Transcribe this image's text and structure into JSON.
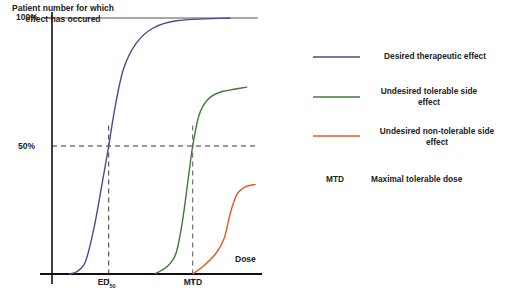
{
  "chart_data": {
    "type": "line",
    "title": "",
    "ylabel": "Patient number for which effect has occured",
    "xlabel": "Dose",
    "ylim": [
      0,
      100
    ],
    "xlim": [
      0,
      100
    ],
    "y_ticks": [
      {
        "value": 100,
        "label": "100%"
      },
      {
        "value": 50,
        "label": "50%"
      }
    ],
    "x_markers": [
      {
        "name": "ED50",
        "label_main": "ED",
        "label_sub": "50",
        "x": 27
      },
      {
        "name": "MTD",
        "label_main": "MTD",
        "label_sub": "",
        "x": 67
      }
    ],
    "reference_lines": [
      {
        "orientation": "horizontal",
        "y": 100,
        "style": "solid"
      },
      {
        "orientation": "horizontal",
        "y": 50,
        "style": "dashed"
      }
    ],
    "series": [
      {
        "name": "Desired therapeutic effect",
        "color": "#4b4a8c",
        "points": [
          [
            8,
            0
          ],
          [
            12,
            1
          ],
          [
            16,
            5
          ],
          [
            20,
            18
          ],
          [
            24,
            36
          ],
          [
            27,
            50
          ],
          [
            30,
            65
          ],
          [
            34,
            80
          ],
          [
            40,
            90
          ],
          [
            48,
            96
          ],
          [
            60,
            99
          ],
          [
            85,
            100
          ]
        ]
      },
      {
        "name": "Undesired tolerable side effect",
        "color": "#3f7a3a",
        "points": [
          [
            49,
            0
          ],
          [
            55,
            3
          ],
          [
            59,
            8
          ],
          [
            62,
            20
          ],
          [
            65,
            38
          ],
          [
            67,
            50
          ],
          [
            70,
            62
          ],
          [
            74,
            68
          ],
          [
            80,
            71
          ],
          [
            93,
            73
          ]
        ]
      },
      {
        "name": "Undesired non-tolerable side effect",
        "color": "#e8562a",
        "points": [
          [
            67,
            0
          ],
          [
            72,
            3
          ],
          [
            78,
            8
          ],
          [
            82,
            14
          ],
          [
            85,
            24
          ],
          [
            88,
            31
          ],
          [
            92,
            34
          ],
          [
            97,
            35
          ]
        ]
      }
    ],
    "legend": {
      "placement": "right",
      "entries": [
        {
          "label": "Desired therapeutic effect",
          "color": "#4b4a8c",
          "type": "line"
        },
        {
          "label": "Undesired tolerable side effect",
          "color": "#3f7a3a",
          "type": "line"
        },
        {
          "label": "Undesired non-tolerable side effect",
          "color": "#e8562a",
          "type": "line"
        },
        {
          "label": "Maximal tolerable dose",
          "key": "MTD",
          "type": "abbrev"
        }
      ]
    },
    "grid": false
  }
}
